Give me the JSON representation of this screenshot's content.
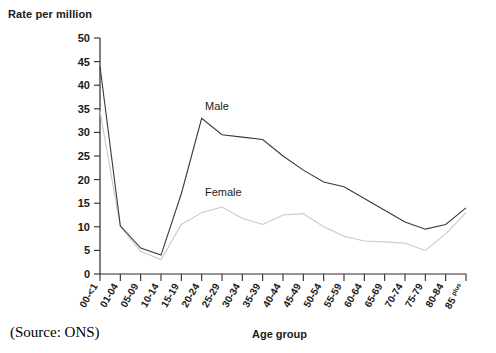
{
  "chart_data": {
    "type": "line",
    "title": "",
    "ylabel": "Rate per million",
    "xlabel": "Age group",
    "source": "(Source: ONS)",
    "ylim": [
      0,
      50
    ],
    "ytick_step": 5,
    "grid": false,
    "legend_position": "inline-annotations",
    "yticks": [
      "0",
      "5",
      "10",
      "15",
      "20",
      "25",
      "30",
      "35",
      "40",
      "45",
      "50"
    ],
    "categories": [
      "00-<1",
      "01-04",
      "05-09",
      "10-14",
      "15-19",
      "20-24",
      "25-29",
      "30-34",
      "35-39",
      "40-44",
      "45-49",
      "50-54",
      "55-59",
      "60-64",
      "65-69",
      "70-74",
      "75-79",
      "80-84",
      "85 plus"
    ],
    "last_category_main": "85",
    "last_category_sup": "plus",
    "series": [
      {
        "name": "Male",
        "color": "#3a3a3a",
        "values": [
          44,
          10.2,
          5.5,
          4,
          17,
          33,
          29.5,
          29,
          28.5,
          25,
          22,
          19.5,
          18.5,
          16,
          13.5,
          11,
          9.5,
          10.5,
          14
        ]
      },
      {
        "name": "Female",
        "color": "#c9c9c9",
        "values": [
          34.5,
          10,
          4.8,
          3,
          10.5,
          13,
          14.2,
          11.8,
          10.5,
          12.5,
          12.8,
          10,
          8,
          7,
          6.8,
          6.5,
          5,
          8.5,
          13
        ]
      }
    ],
    "annotations": [
      {
        "text": "Male",
        "x_index": 5,
        "y_value": 36
      },
      {
        "text": "Female",
        "x_index": 6,
        "y_value": 18
      }
    ]
  }
}
